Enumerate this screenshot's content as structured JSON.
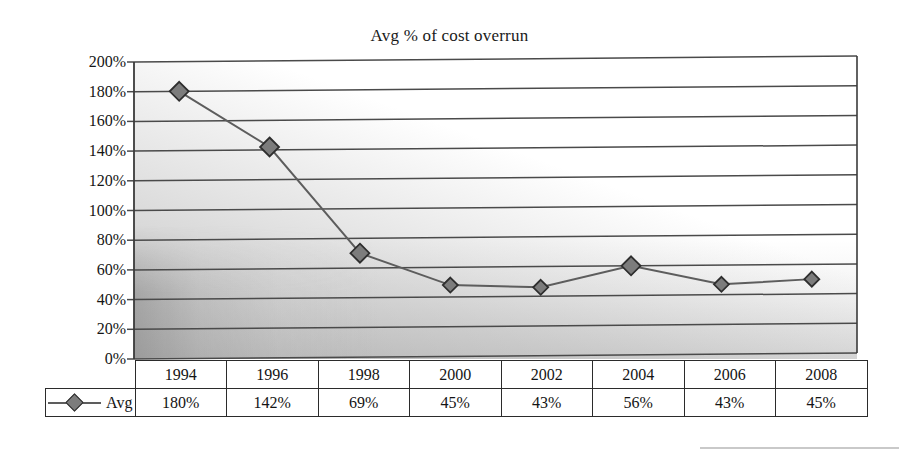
{
  "chart_data": {
    "type": "line",
    "title": "Avg % of cost overrun",
    "xlabel": "",
    "ylabel": "",
    "categories": [
      "1994",
      "1996",
      "1998",
      "2000",
      "2002",
      "2004",
      "2006",
      "2008"
    ],
    "series": [
      {
        "name": "Avg",
        "values": [
          180,
          142,
          69,
          45,
          43,
          56,
          43,
          45
        ],
        "value_labels": [
          "180%",
          "142%",
          "69%",
          "45%",
          "43%",
          "56%",
          "43%",
          "45%"
        ],
        "plotted_values": [
          180,
          142,
          70,
          48,
          46,
          60,
          47,
          50
        ],
        "marker": "diamond",
        "marker_color": "#7c7c7c",
        "marker_edge_color": "#2e2e2e",
        "line_color": "#5d5d5d"
      }
    ],
    "ylim": [
      0,
      200
    ],
    "ytick_step": 20,
    "ytick_labels": [
      "200%",
      "180%",
      "160%",
      "140%",
      "120%",
      "100%",
      "80%",
      "60%",
      "40%",
      "20%",
      "0%"
    ],
    "ytick_values": [
      200,
      180,
      160,
      140,
      120,
      100,
      80,
      60,
      40,
      20,
      0
    ],
    "grid": true,
    "grid_axis": "y",
    "legend_position": "bottom-left-table",
    "has_data_table": true,
    "plot_bg": "gradient-gray",
    "gridline_color": "#4a4a4a"
  },
  "legend": {
    "series_label": "Avg",
    "marker_icon": "diamond-marker-icon"
  },
  "table": {
    "header_row": [
      "1994",
      "1996",
      "1998",
      "2000",
      "2002",
      "2004",
      "2006",
      "2008"
    ],
    "data_row": [
      "180%",
      "142%",
      "69%",
      "45%",
      "43%",
      "56%",
      "43%",
      "45%"
    ]
  }
}
